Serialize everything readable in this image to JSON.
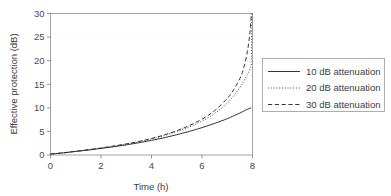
{
  "chart_data": {
    "type": "line",
    "title": "",
    "xlabel": "Time (h)",
    "ylabel": "Effective protection (dB)",
    "xlim": [
      0,
      8
    ],
    "ylim": [
      0,
      30
    ],
    "xticks": [
      0,
      2,
      4,
      6,
      8
    ],
    "yticks": [
      0,
      5,
      10,
      15,
      20,
      25,
      30
    ],
    "grid": true,
    "grid_axis": "y",
    "legend_position": "right-outside",
    "x": [
      0,
      0.5,
      1,
      1.5,
      2,
      2.5,
      3,
      3.5,
      4,
      4.5,
      5,
      5.5,
      6,
      6.5,
      7,
      7.25,
      7.5,
      7.65,
      7.8,
      7.9,
      7.95
    ],
    "series": [
      {
        "name": "10 dB attenuation",
        "style": "solid",
        "color": "#2b2b2b",
        "values": [
          0.2,
          0.45,
          0.75,
          1.05,
          1.4,
          1.75,
          2.15,
          2.6,
          3.1,
          3.65,
          4.3,
          5.0,
          5.8,
          6.7,
          7.7,
          8.3,
          8.9,
          9.3,
          9.7,
          9.9,
          10.0
        ]
      },
      {
        "name": "20 dB attenuation",
        "style": "dotted",
        "color": "#2b2b2b",
        "values": [
          0.2,
          0.45,
          0.78,
          1.1,
          1.45,
          1.85,
          2.3,
          2.8,
          3.4,
          4.1,
          4.95,
          5.95,
          7.2,
          8.8,
          11.0,
          12.5,
          14.3,
          15.6,
          17.1,
          18.2,
          19.0
        ]
      },
      {
        "name": "30 dB attenuation",
        "style": "dashed",
        "color": "#2b2b2b",
        "values": [
          0.2,
          0.45,
          0.8,
          1.12,
          1.48,
          1.9,
          2.35,
          2.88,
          3.5,
          4.25,
          5.15,
          6.25,
          7.6,
          9.4,
          12.0,
          13.8,
          16.2,
          18.4,
          22.0,
          26.0,
          29.5
        ]
      }
    ]
  },
  "axes": {
    "x": {
      "title": "Time (h)",
      "tick_labels": [
        "0",
        "2",
        "4",
        "6",
        "8"
      ]
    },
    "y": {
      "title": "Effective protection (dB)",
      "tick_labels": [
        "0",
        "5",
        "10",
        "15",
        "20",
        "25",
        "30"
      ]
    }
  },
  "legend": {
    "entries": [
      {
        "label": "10 dB attenuation",
        "style": "solid"
      },
      {
        "label": "20 dB attenuation",
        "style": "dotted"
      },
      {
        "label": "30 dB attenuation",
        "style": "dashed"
      }
    ]
  }
}
